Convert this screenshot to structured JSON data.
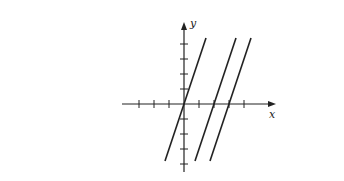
{
  "chart_data": {
    "type": "line",
    "title": "",
    "xlabel": "x",
    "ylabel": "y",
    "xlim": [
      -4,
      6
    ],
    "ylim": [
      -4.5,
      5.5
    ],
    "grid": false,
    "x_ticks": [
      -3,
      -2,
      -1,
      1,
      2,
      3,
      4
    ],
    "y_ticks": [
      -4,
      -3,
      -2,
      -1,
      1,
      2,
      3,
      4
    ],
    "tick_labels_shown": false,
    "series": [
      {
        "name": "line-1",
        "equation": "y = 3x",
        "slope": 3,
        "x_intercept": 0,
        "y_range": [
          -3.8,
          4.4
        ]
      },
      {
        "name": "line-2",
        "equation": "y = 3x - 6",
        "slope": 3,
        "x_intercept": 2,
        "y_range": [
          -3.8,
          4.4
        ]
      },
      {
        "name": "line-3",
        "equation": "y = 3x - 9",
        "slope": 3,
        "x_intercept": 3,
        "y_range": [
          -3.8,
          4.4
        ]
      }
    ],
    "layout": {
      "origin_px": [
        184,
        104
      ],
      "unit_px": 15,
      "x_axis_px": [
        122,
        276
      ],
      "y_axis_px": [
        22,
        172
      ],
      "line_color": "#222222"
    }
  },
  "labels": {
    "x_axis": "x",
    "y_axis": "y"
  }
}
